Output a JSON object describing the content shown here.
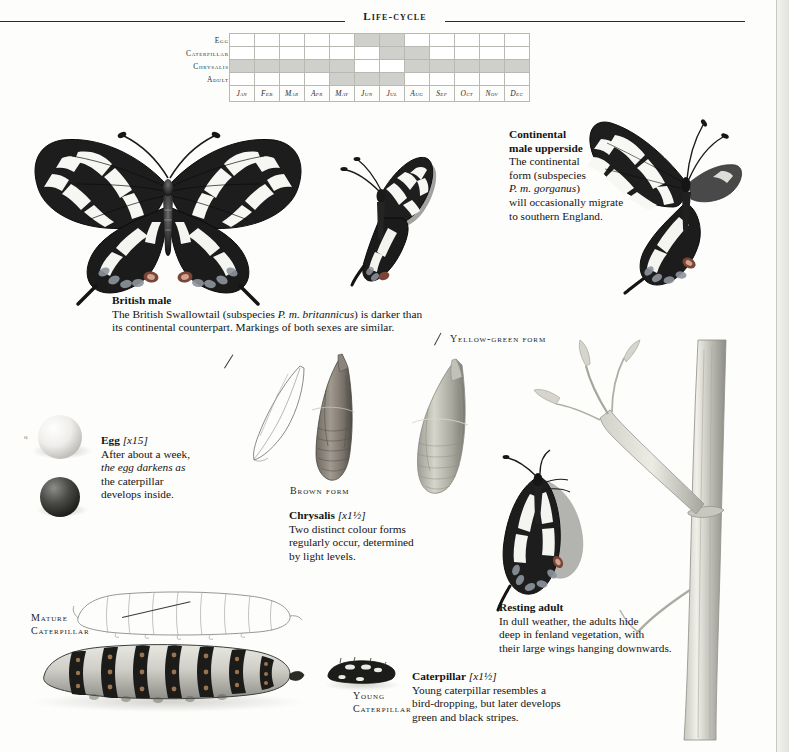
{
  "header": {
    "title": "Life-cycle"
  },
  "lifecycle": {
    "stages": [
      "Egg",
      "Caterpillar",
      "Chrysalis",
      "Adult"
    ],
    "months": [
      "Jan",
      "Feb",
      "Mar",
      "Apr",
      "May",
      "Jun",
      "Jul",
      "Aug",
      "Sep",
      "Oct",
      "Nov",
      "Dec"
    ],
    "active_color": "#cfcfcb",
    "inactive_color": "#ffffff",
    "grid": [
      [
        0,
        0,
        0,
        0,
        0,
        1,
        1,
        0,
        0,
        0,
        0,
        0
      ],
      [
        0,
        0,
        0,
        0,
        0,
        0,
        1,
        1,
        0,
        0,
        0,
        0
      ],
      [
        1,
        1,
        1,
        1,
        1,
        0,
        0,
        1,
        1,
        1,
        1,
        1
      ],
      [
        0,
        0,
        0,
        0,
        1,
        1,
        1,
        0,
        0,
        0,
        0,
        0
      ]
    ]
  },
  "captions": {
    "british_male": {
      "title": "British male",
      "line1_a": "The British Swallowtail (subspecies ",
      "line1_it": "P. m. britannicus",
      "line1_b": ") is darker than",
      "line2": "its continental counterpart. Markings of both sexes are similar."
    },
    "continental": {
      "title_line1": "Continental",
      "title_line2": "male upperside",
      "body_line1": "The continental",
      "body_line2": "form (subspecies",
      "body_line3_it": "P. m. gorganus",
      "body_line3_b": ")",
      "body_line4": "will occasionally migrate",
      "body_line5": "to southern England."
    },
    "egg": {
      "title": "Egg",
      "magnification": "[x15]",
      "line1": "After about a week,",
      "line2_it": "the egg darkens as",
      "line3": "the caterpillar",
      "line4": "develops inside."
    },
    "chrysalis": {
      "title": "Chrysalis",
      "magnification": "[x1½]",
      "line1": "Two distinct colour forms",
      "line2": "regularly occur, determined",
      "line3": "by light levels."
    },
    "resting_adult": {
      "title": "Resting adult",
      "line1": "In dull weather, the adults hide",
      "line2": "deep in fenland vegetation, with",
      "line3": "their large wings hanging downwards."
    },
    "caterpillar": {
      "title": "Caterpillar",
      "magnification": "[x1½]",
      "line1": "Young caterpillar resembles a",
      "line2": "bird-dropping, but later develops",
      "line3": "green and black stripes."
    }
  },
  "labels": {
    "yellow_green_form": "Yellow-green form",
    "brown_form": "Brown form",
    "mature_caterpillar_line1": "Mature",
    "mature_caterpillar_line2": "Caterpillar",
    "young_caterpillar_line1": "Young",
    "young_caterpillar_line2": "Caterpillar"
  },
  "illustrations": {
    "british_male_butterfly": "swallowtail-butterfly-spread-wings",
    "continental_male_butterfly": "swallowtail-butterfly-continental",
    "side_butterfly": "swallowtail-butterfly-side-view",
    "egg_pale": "butterfly-egg-pale",
    "egg_dark": "butterfly-egg-dark",
    "chrysalis_outline": "chrysalis-outline-sketch",
    "chrysalis_brown": "chrysalis-brown-form",
    "chrysalis_green": "chrysalis-yellow-green-form",
    "resting_adult": "swallowtail-resting-on-stem",
    "plant_stem": "fenland-plant-stem",
    "mature_caterpillar_outline": "caterpillar-outline-sketch",
    "mature_caterpillar": "mature-caterpillar-striped",
    "young_caterpillar": "young-caterpillar-bird-dropping"
  }
}
